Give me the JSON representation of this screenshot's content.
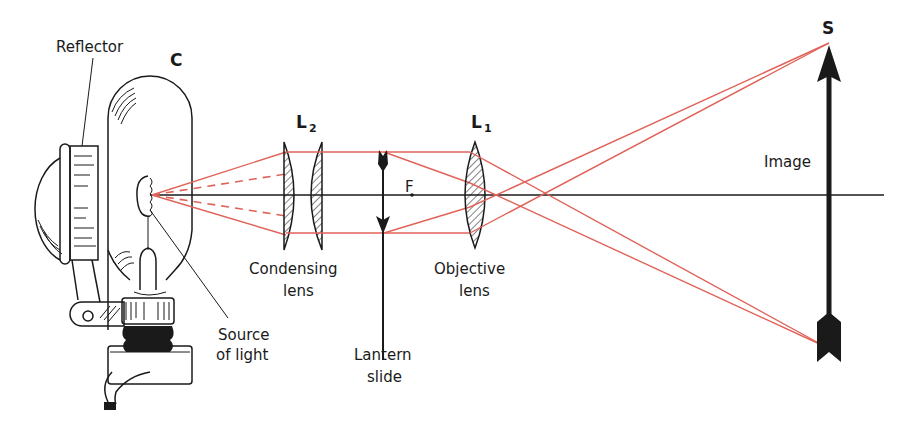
{
  "colors": {
    "ray": "#e0635a",
    "ink": "#1a1a1a",
    "background": "#ffffff"
  },
  "labels": {
    "reflector": "Reflector",
    "lamp": "C",
    "source_line1": "Source",
    "source_line2": "of light",
    "condenser_symbol": "L",
    "condenser_subscript": "2",
    "condenser_line1": "Condensing",
    "condenser_line2": "lens",
    "slide_line1": "Lantern",
    "slide_line2": "slide",
    "focal_point": "F",
    "objective_symbol": "L",
    "objective_subscript": "1",
    "objective_line1": "Objective",
    "objective_line2": "lens",
    "image": "Image",
    "screen": "S"
  }
}
